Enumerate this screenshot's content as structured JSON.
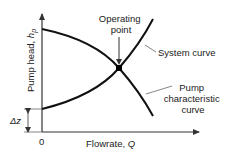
{
  "diagram": {
    "y_axis": {
      "label": "Pump head, ",
      "var": "h",
      "sub": "p"
    },
    "x_axis": {
      "label": "Flowrate, ",
      "var": "Q"
    },
    "origin_label": "0",
    "delta_z_label": "Δz",
    "operating_point": {
      "line1": "Operating",
      "line2": "point"
    },
    "system_curve_label": "System curve",
    "pump_curve_label": {
      "line1": "Pump",
      "line2": "characteristic",
      "line3": "curve"
    },
    "colors": {
      "line": "#111111",
      "text": "#222222",
      "leader": "#666666"
    }
  }
}
